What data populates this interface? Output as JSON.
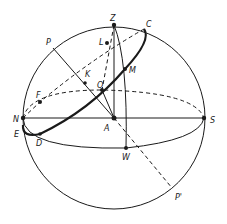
{
  "diagram": {
    "type": "celestial-sphere",
    "colors": {
      "stroke": "#1a1a1a",
      "background": "#ffffff"
    },
    "labels": {
      "Z": "Z",
      "C": "C",
      "P": "P",
      "L": "L",
      "K": "K",
      "O": "O",
      "M": "M",
      "F": "F",
      "N": "N",
      "A": "A",
      "S": "S",
      "E": "E",
      "D": "D",
      "W": "W",
      "P_prime": "P'"
    }
  }
}
